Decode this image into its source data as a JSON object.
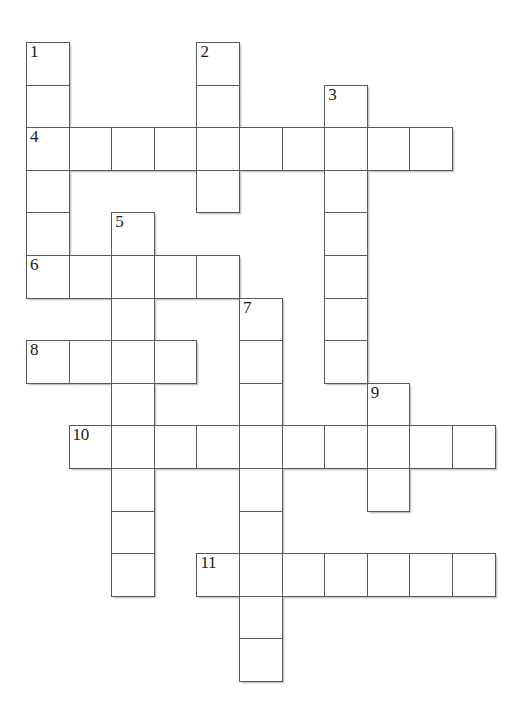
{
  "puzzle": {
    "title": "Crossword Puzzle Grid",
    "cell_size": 42.6,
    "origin_x": 26,
    "origin_y": 42,
    "columns": 11,
    "rows": 15,
    "colors": {
      "background": "#ffffff",
      "cell_fill": "#ffffff",
      "cell_border": "#5a5a5a",
      "number_text": "#1a1a1a",
      "shadow": "#969696"
    },
    "entries": [
      {
        "number": "1",
        "direction": "down",
        "col": 0,
        "row": 0,
        "length": 6,
        "label": "1-down"
      },
      {
        "number": "2",
        "direction": "down",
        "col": 4,
        "row": 0,
        "length": 4,
        "label": "2-down"
      },
      {
        "number": "3",
        "direction": "down",
        "col": 7,
        "row": 1,
        "length": 7,
        "label": "3-down"
      },
      {
        "number": "4",
        "direction": "across",
        "col": 0,
        "row": 2,
        "length": 10,
        "label": "4-across"
      },
      {
        "number": "5",
        "direction": "down",
        "col": 2,
        "row": 4,
        "length": 9,
        "label": "5-down"
      },
      {
        "number": "6",
        "direction": "across",
        "col": 0,
        "row": 5,
        "length": 5,
        "label": "6-across"
      },
      {
        "number": "7",
        "direction": "down",
        "col": 5,
        "row": 6,
        "length": 9,
        "label": "7-down"
      },
      {
        "number": "8",
        "direction": "across",
        "col": 0,
        "row": 7,
        "length": 4,
        "label": "8-across"
      },
      {
        "number": "9",
        "direction": "down",
        "col": 8,
        "row": 8,
        "length": 3,
        "label": "9-down"
      },
      {
        "number": "10",
        "direction": "across",
        "col": 1,
        "row": 9,
        "length": 10,
        "label": "10-across"
      },
      {
        "number": "11",
        "direction": "across",
        "col": 4,
        "row": 12,
        "length": 7,
        "label": "11-across"
      }
    ],
    "numbered_cells": [
      {
        "number": "1",
        "col": 0,
        "row": 0
      },
      {
        "number": "2",
        "col": 4,
        "row": 0
      },
      {
        "number": "3",
        "col": 7,
        "row": 1
      },
      {
        "number": "4",
        "col": 0,
        "row": 2
      },
      {
        "number": "5",
        "col": 2,
        "row": 4
      },
      {
        "number": "6",
        "col": 0,
        "row": 5
      },
      {
        "number": "7",
        "col": 5,
        "row": 6
      },
      {
        "number": "8",
        "col": 0,
        "row": 7
      },
      {
        "number": "9",
        "col": 8,
        "row": 8
      },
      {
        "number": "10",
        "col": 1,
        "row": 9
      },
      {
        "number": "11",
        "col": 4,
        "row": 12
      }
    ],
    "cell_letters": {}
  }
}
